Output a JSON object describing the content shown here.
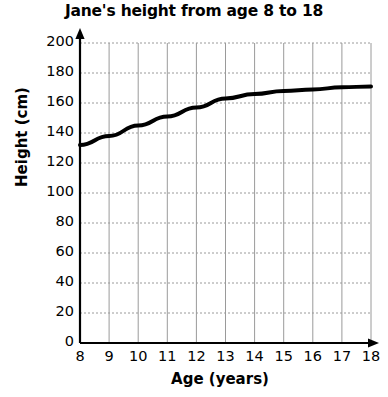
{
  "chart_data": {
    "type": "line",
    "title": "Jane's height from age 8 to 18",
    "xlabel": "Age (years)",
    "ylabel": "Height (cm)",
    "xlim": [
      8,
      18
    ],
    "ylim": [
      0,
      200
    ],
    "xticks": [
      8,
      9,
      10,
      11,
      12,
      13,
      14,
      15,
      16,
      17,
      18
    ],
    "xtick_labels": [
      "8",
      "9",
      "10",
      "11",
      "12",
      "13",
      "14",
      "15",
      "16",
      "17",
      "18"
    ],
    "yticks": [
      0,
      20,
      40,
      60,
      80,
      100,
      120,
      140,
      160,
      180,
      200
    ],
    "ytick_labels": [
      "0",
      "20",
      "40",
      "60",
      "80",
      "100",
      "120",
      "140",
      "160",
      "180",
      "200"
    ],
    "grid": true,
    "grid_color": "#9a9a9a",
    "legend": "none",
    "axis_arrows": true,
    "series": [
      {
        "name": "Jane's height",
        "color": "#000000",
        "line_width": 4,
        "x": [
          8,
          9,
          10,
          11,
          12,
          13,
          14,
          15,
          16,
          17,
          18
        ],
        "values": [
          132,
          138,
          145,
          151,
          157,
          163,
          166,
          168,
          169,
          170.5,
          171
        ]
      }
    ]
  },
  "axes": {
    "y_axis_name": "height-axis",
    "x_axis_name": "age-axis"
  }
}
